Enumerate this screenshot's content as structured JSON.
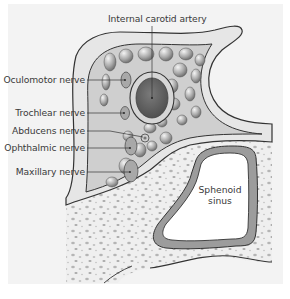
{
  "diagram": {
    "labels": {
      "internal_carotid_artery": "Internal carotid artery",
      "oculomotor_nerve": "Oculomotor nerve",
      "trochlear_nerve": "Trochlear nerve",
      "abducens_nerve": "Abducens nerve",
      "ophthalmic_nerve": "Ophthalmic nerve",
      "maxillary_nerve": "Maxillary nerve",
      "sphenoid_sinus_line1": "Sphenoid",
      "sphenoid_sinus_line2": "sinus"
    },
    "colors": {
      "panel": "#f3f3f3",
      "outline": "#333333",
      "dura": "#e4e4e4",
      "trabecular": "#c9c9c9",
      "vessel_lumen": "#6a6a6a",
      "nerve": "#a9a9a9",
      "bone": "#ececec",
      "mucosa": "#9a9a9a",
      "sinus_air": "#ffffff"
    }
  }
}
